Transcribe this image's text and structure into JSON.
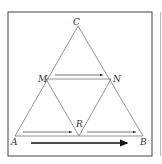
{
  "figure": {
    "type": "geometry-diagram",
    "points": {
      "A": {
        "label": "A",
        "x": 15,
        "y": 136
      },
      "B": {
        "label": "B",
        "x": 143,
        "y": 136
      },
      "C": {
        "label": "C",
        "x": 78,
        "y": 26
      },
      "M": {
        "label": "M",
        "x": 46,
        "y": 79
      },
      "N": {
        "label": "N",
        "x": 111,
        "y": 79
      },
      "R": {
        "label": "R",
        "x": 79,
        "y": 136
      }
    },
    "segments": [
      "AC",
      "BC",
      "AB",
      "MN",
      "MR",
      "NR"
    ],
    "arrows": [
      {
        "from": "M",
        "to": "N",
        "style": "thin",
        "position": "above MN"
      },
      {
        "from": "A",
        "to": "R",
        "style": "thin",
        "position": "above AR"
      },
      {
        "from": "R",
        "to": "B",
        "style": "thin",
        "position": "above RB"
      },
      {
        "from": "A",
        "to": "B",
        "style": "bold",
        "position": "below AB"
      }
    ],
    "colors": {
      "stroke": "#555555",
      "frame": "#444444",
      "background": "#ffffff"
    }
  }
}
